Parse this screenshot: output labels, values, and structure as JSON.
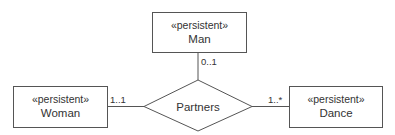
{
  "diagram": {
    "type": "uml-association",
    "classes": {
      "man": {
        "stereotype": "«persistent»",
        "name": "Man"
      },
      "woman": {
        "stereotype": "«persistent»",
        "name": "Woman"
      },
      "dance": {
        "stereotype": "«persistent»",
        "name": "Dance"
      }
    },
    "association": {
      "name": "Partners",
      "shape": "diamond",
      "ends": {
        "man": {
          "multiplicity": "0..1"
        },
        "woman": {
          "multiplicity": "1..1"
        },
        "dance": {
          "multiplicity": "1..*"
        }
      }
    },
    "colors": {
      "line": "#555555",
      "text": "#333333",
      "background": "#ffffff"
    }
  }
}
